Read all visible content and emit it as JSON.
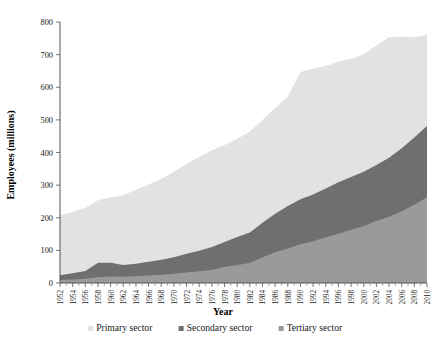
{
  "chart_data": {
    "type": "area",
    "stacked": true,
    "title": "",
    "xlabel": "Year",
    "ylabel": "Employees (millions)",
    "ylim": [
      0,
      800
    ],
    "yticks": [
      0,
      100,
      200,
      300,
      400,
      500,
      600,
      700,
      800
    ],
    "xlim": [
      1952,
      2010
    ],
    "grid": false,
    "legend_position": "bottom",
    "categories": [
      1952,
      1954,
      1956,
      1958,
      1960,
      1962,
      1964,
      1966,
      1968,
      1970,
      1972,
      1974,
      1976,
      1978,
      1980,
      1982,
      1984,
      1986,
      1988,
      1990,
      1992,
      1994,
      1996,
      1998,
      2000,
      2002,
      2004,
      2006,
      2008,
      2010
    ],
    "xtick_labels": [
      "1952",
      "1954",
      "1956",
      "1958",
      "1960",
      "1962",
      "1964",
      "1966",
      "1968",
      "1970",
      "1972",
      "1974",
      "1976",
      "1978",
      "1980",
      "1982",
      "1984",
      "1986",
      "1988",
      "1990",
      "1992",
      "1994",
      "1996",
      "1998",
      "2000",
      "2002",
      "2004",
      "2006",
      "2008",
      "2010"
    ],
    "series": [
      {
        "name": "Tertiary sector",
        "color": "#9a9a9a",
        "stack_order": 1,
        "values": [
          9,
          11,
          13,
          18,
          20,
          19,
          21,
          23,
          25,
          28,
          32,
          36,
          40,
          49,
          55,
          61,
          79,
          94,
          106,
          119,
          128,
          140,
          151,
          163,
          175,
          190,
          203,
          220,
          240,
          263
        ]
      },
      {
        "name": "Secondary sector",
        "color": "#6f6f6f",
        "stack_order": 2,
        "values": [
          15,
          19,
          24,
          44,
          42,
          36,
          38,
          42,
          46,
          51,
          58,
          63,
          70,
          77,
          86,
          94,
          106,
          118,
          130,
          138,
          143,
          150,
          158,
          162,
          166,
          172,
          181,
          193,
          206,
          218
        ]
      },
      {
        "name": "Primary sector",
        "color": "#e2e2e2",
        "stack_order": 3,
        "values": [
          184,
          188,
          193,
          192,
          200,
          215,
          226,
          237,
          248,
          262,
          275,
          288,
          297,
          297,
          300,
          309,
          315,
          324,
          335,
          390,
          386,
          375,
          369,
          362,
          360,
          366,
          369,
          342,
          307,
          279
        ]
      }
    ],
    "totals": [
      208,
      218,
      230,
      254,
      262,
      270,
      285,
      302,
      319,
      341,
      365,
      387,
      407,
      423,
      441,
      464,
      500,
      536,
      571,
      647,
      657,
      665,
      678,
      687,
      701,
      728,
      753,
      755,
      753,
      760
    ]
  },
  "legend": {
    "items": [
      {
        "label": "Primary sector",
        "color": "#e2e2e2"
      },
      {
        "label": "Secondary sector",
        "color": "#6f6f6f"
      },
      {
        "label": "Tertiary sector",
        "color": "#9a9a9a"
      }
    ]
  },
  "axes": {
    "x_title": "Year",
    "y_title": "Employees (millions)"
  }
}
